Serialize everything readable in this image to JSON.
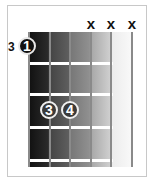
{
  "diagram": {
    "type": "chord-diagram",
    "start_fret_label": "3",
    "strings": 6,
    "frets_shown": 4,
    "muted_strings": [
      {
        "string": 4,
        "symbol": "x"
      },
      {
        "string": 5,
        "symbol": "x"
      },
      {
        "string": 6,
        "symbol": "x"
      }
    ],
    "fingers": [
      {
        "label": "1",
        "string": 1,
        "fret": 1,
        "style": "root"
      },
      {
        "label": "3",
        "string": 2,
        "fret": 3,
        "style": "normal"
      },
      {
        "label": "4",
        "string": 3,
        "fret": 3,
        "style": "normal"
      }
    ],
    "colors": {
      "board_dark": "#111111",
      "board_light": "#fafafa",
      "string": "#8a8a8a",
      "fret": "#ffffff",
      "dot_root": "#111111",
      "dot_normal": "#3a3a3a"
    }
  }
}
